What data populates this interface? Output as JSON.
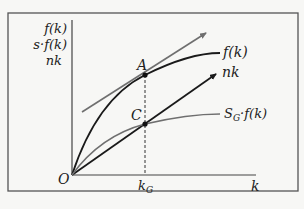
{
  "diagram": {
    "y_axis_labels": [
      "f(k)",
      "s·f(k)",
      "nk"
    ],
    "x_axis_label": "k",
    "origin_label": "O",
    "tick_label": "k",
    "tick_label_sub": "G",
    "curves": {
      "production": "f(k)",
      "investment": "nk",
      "savings_main": "S",
      "savings_sub": "G",
      "savings_rest": "·f(k)"
    },
    "points": {
      "A": "A",
      "C": "C"
    },
    "colors": {
      "frame": "#555555",
      "curve_dark": "#1a1a1a",
      "curve_gray": "#6f6f6f",
      "background": "#f7f7f5"
    }
  }
}
